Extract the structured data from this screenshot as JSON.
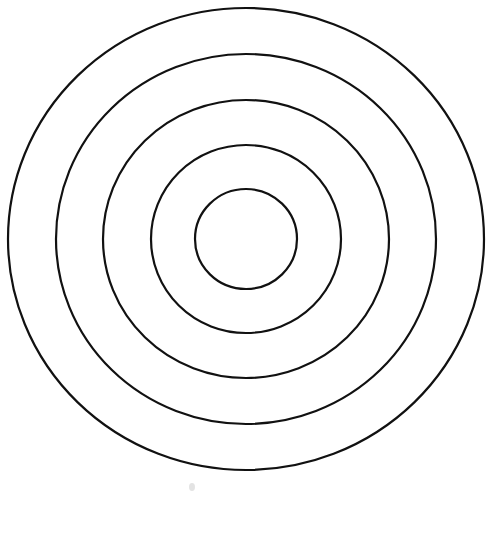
{
  "diagram": {
    "type": "concentric-circles",
    "background": "#ffffff",
    "stroke_color": "#111111",
    "center": {
      "cx": 246,
      "cy": 239
    },
    "rings": [
      {
        "name": "ring-1",
        "rx": 51,
        "ry": 50
      },
      {
        "name": "ring-2",
        "rx": 95,
        "ry": 94
      },
      {
        "name": "ring-3",
        "rx": 143,
        "ry": 139
      },
      {
        "name": "ring-4",
        "rx": 190,
        "ry": 185
      },
      {
        "name": "ring-5",
        "rx": 238,
        "ry": 231
      }
    ],
    "ring_count": 5
  }
}
